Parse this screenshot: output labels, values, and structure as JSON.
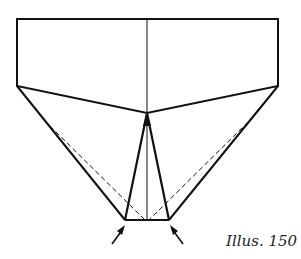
{
  "caption": "Illus. 150",
  "diagram": {
    "type": "origami-fold-step",
    "arrows": [
      "arrow-left-up",
      "arrow-right-up"
    ]
  }
}
